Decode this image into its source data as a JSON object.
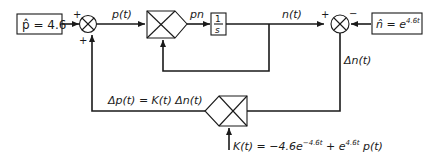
{
  "diagram": {
    "type": "control-loop-block-diagram",
    "colors": {
      "stroke": "#1a1a1a",
      "background": "#ffffff"
    },
    "blocks": {
      "setpoint_p": {
        "label": "p̂ = 4.6"
      },
      "setpoint_n": {
        "label_base": "n̂ = e",
        "label_exp": "4.6t"
      },
      "integrator": {
        "numerator": "1",
        "denominator": "s"
      }
    },
    "summing_junctions": {
      "left": {
        "sign_top": "+",
        "sign_bottom": "+"
      },
      "right": {
        "sign_left": "+",
        "sign_right": "−"
      }
    },
    "signals": {
      "p_t": "p(t)",
      "pn": "pn",
      "n_t": "n(t)",
      "delta_n": "Δn(t)",
      "delta_p": "Δp(t) = K(t) Δn(t)"
    },
    "gain": {
      "k_prefix": "K(t) = −4.6e",
      "k_exp1": "−4.6t",
      "k_mid": " + e",
      "k_exp2": "4.6t",
      "k_suffix": " p(t)"
    }
  }
}
